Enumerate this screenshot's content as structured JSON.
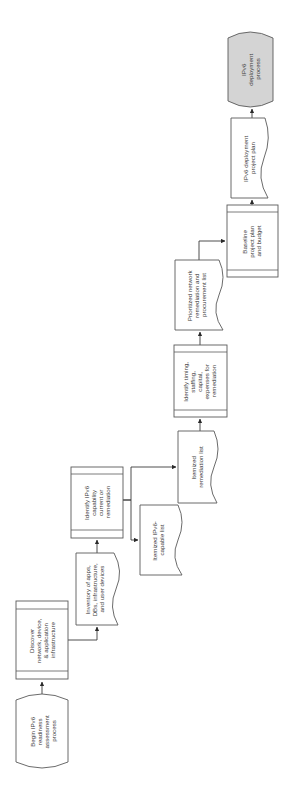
{
  "diagram": {
    "orientation": "rotated 90° counter-clockwise",
    "colors": {
      "stroke": "#5a5a5a",
      "fill": "#ffffff",
      "end_fill": "#d4d4d4",
      "text": "#3a3a3a"
    },
    "nodes": {
      "begin": {
        "type": "terminal",
        "lines": [
          "Begin IPv6",
          "readiness",
          "assessment",
          "process"
        ]
      },
      "discover": {
        "type": "process",
        "lines": [
          "Discover",
          "network, device,",
          "& application",
          "infrastructure"
        ]
      },
      "inventory": {
        "type": "document",
        "lines": [
          "Inventory of apps,",
          "DBs, infrastructure,",
          "and user devices"
        ]
      },
      "identify_capability": {
        "type": "process",
        "lines": [
          "Identify IPv6",
          "capability",
          "current or",
          "remediation"
        ]
      },
      "itemized_capable": {
        "type": "document",
        "lines": [
          "Itemized IPv6-",
          "capable list"
        ]
      },
      "itemized_remediation": {
        "type": "document",
        "lines": [
          "Itemized",
          "remediation list"
        ]
      },
      "identify_timing": {
        "type": "process",
        "lines": [
          "Identify timing,",
          "staffing,",
          "capital,",
          "expenses for",
          "remediation"
        ]
      },
      "prioritized": {
        "type": "document",
        "lines": [
          "Prioritized network",
          "remediation and",
          "procurement  list"
        ]
      },
      "baseline": {
        "type": "process",
        "lines": [
          "Baseline",
          "project plan",
          "and budget"
        ]
      },
      "project_plan": {
        "type": "document",
        "lines": [
          "IPv6 deployment",
          "project plan"
        ]
      },
      "deployment": {
        "type": "terminal",
        "lines": [
          "IPv6",
          "deployment",
          "process"
        ]
      }
    },
    "edges": [
      {
        "from": "begin",
        "to": "discover"
      },
      {
        "from": "discover",
        "to": "inventory"
      },
      {
        "from": "inventory",
        "to": "identify_capability"
      },
      {
        "from": "identify_capability",
        "to": "itemized_capable"
      },
      {
        "from": "identify_capability",
        "to": "itemized_remediation"
      },
      {
        "from": "itemized_remediation",
        "to": "identify_timing"
      },
      {
        "from": "identify_timing",
        "to": "prioritized"
      },
      {
        "from": "prioritized",
        "to": "baseline"
      },
      {
        "from": "baseline",
        "to": "project_plan"
      },
      {
        "from": "project_plan",
        "to": "deployment"
      }
    ]
  }
}
